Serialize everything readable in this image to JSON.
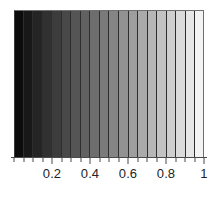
{
  "chart_data": {
    "type": "heatmap",
    "title": "",
    "subtitle": "",
    "xlabel": "",
    "ylabel": "",
    "xlim": [
      0,
      1
    ],
    "ylim": [
      0,
      1
    ],
    "grid": false,
    "legend": null,
    "colormap": "grayscale",
    "colormap_direction": "black-to-white",
    "band_count": 20,
    "band_edges": [
      0,
      0.05,
      0.1,
      0.15,
      0.2,
      0.25,
      0.3,
      0.35,
      0.4,
      0.45,
      0.5,
      0.55,
      0.6,
      0.65,
      0.7,
      0.75,
      0.8,
      0.85,
      0.9,
      0.95,
      1
    ],
    "categories": [
      "0.00-0.05",
      "0.05-0.10",
      "0.10-0.15",
      "0.15-0.20",
      "0.20-0.25",
      "0.25-0.30",
      "0.30-0.35",
      "0.35-0.40",
      "0.40-0.45",
      "0.45-0.50",
      "0.50-0.55",
      "0.55-0.60",
      "0.60-0.65",
      "0.65-0.70",
      "0.70-0.75",
      "0.75-0.80",
      "0.80-0.85",
      "0.85-0.90",
      "0.90-0.95",
      "0.95-1.00"
    ],
    "values": [
      0.025,
      0.075,
      0.125,
      0.175,
      0.225,
      0.275,
      0.325,
      0.375,
      0.425,
      0.475,
      0.525,
      0.575,
      0.625,
      0.675,
      0.725,
      0.775,
      0.825,
      0.875,
      0.925,
      0.975
    ],
    "band_colors": [
      "#060606",
      "#131313",
      "#202020",
      "#2d2d2d",
      "#393939",
      "#464646",
      "#535353",
      "#606060",
      "#6d6d6d",
      "#7a7a7a",
      "#868686",
      "#939393",
      "#a0a0a0",
      "#adadad",
      "#bababa",
      "#c7c7c7",
      "#d3d3d3",
      "#e0e0e0",
      "#ededed",
      "#fafafa"
    ],
    "band_separator_color": "#2a2a2a",
    "axis_color": "#4a4a4a",
    "tick_label_color": "#242424",
    "background_color": "#ffffff",
    "x_ticks": [
      {
        "value": 0,
        "label": ""
      },
      {
        "value": 0.05,
        "label": ""
      },
      {
        "value": 0.1,
        "label": ""
      },
      {
        "value": 0.15,
        "label": ""
      },
      {
        "value": 0.2,
        "label": "0.2"
      },
      {
        "value": 0.25,
        "label": ""
      },
      {
        "value": 0.3,
        "label": ""
      },
      {
        "value": 0.35,
        "label": ""
      },
      {
        "value": 0.4,
        "label": "0.4"
      },
      {
        "value": 0.45,
        "label": ""
      },
      {
        "value": 0.5,
        "label": ""
      },
      {
        "value": 0.55,
        "label": ""
      },
      {
        "value": 0.6,
        "label": "0.6"
      },
      {
        "value": 0.65,
        "label": ""
      },
      {
        "value": 0.7,
        "label": ""
      },
      {
        "value": 0.75,
        "label": ""
      },
      {
        "value": 0.8,
        "label": "0.8"
      },
      {
        "value": 0.85,
        "label": ""
      },
      {
        "value": 0.9,
        "label": ""
      },
      {
        "value": 0.95,
        "label": ""
      },
      {
        "value": 1,
        "label": "1"
      }
    ],
    "x_tick_labels": [
      "0.2",
      "0.4",
      "0.6",
      "0.8",
      "1"
    ]
  }
}
